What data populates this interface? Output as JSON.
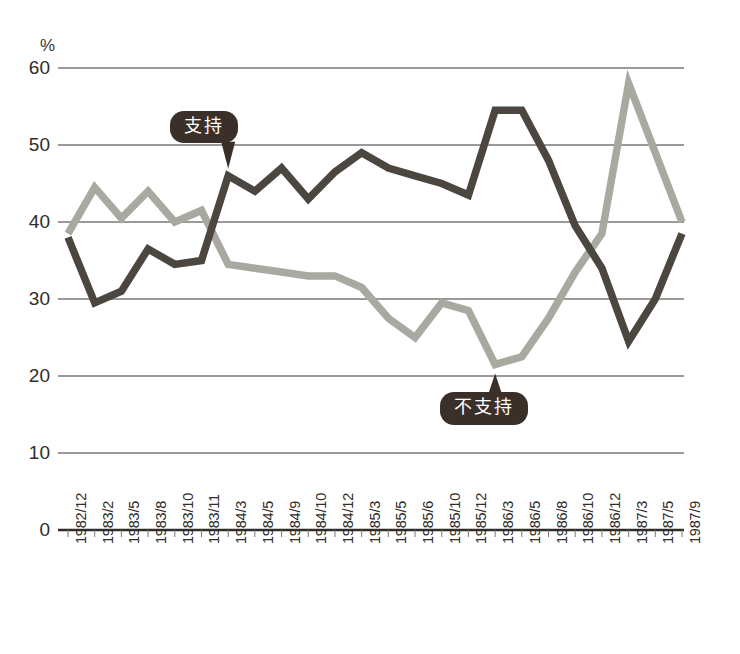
{
  "chart_data": {
    "type": "line",
    "title": "",
    "xlabel": "",
    "ylabel": "%",
    "ylim": [
      0,
      60
    ],
    "yticks": [
      0,
      10,
      20,
      30,
      40,
      50,
      60
    ],
    "grid": true,
    "legend_position": "inline-callouts",
    "categories": [
      "1982/12",
      "1983/2",
      "1983/5",
      "1983/8",
      "1983/10",
      "1983/11",
      "1984/3",
      "1984/5",
      "1984/9",
      "1984/10",
      "1984/12",
      "1985/3",
      "1985/5",
      "1985/6",
      "1985/10",
      "1985/12",
      "1986/3",
      "1986/5",
      "1986/8",
      "1986/10",
      "1986/12",
      "1987/3",
      "1987/5",
      "1987/9"
    ],
    "series": [
      {
        "name": "支持",
        "color": "#4b4640",
        "values": [
          38.0,
          29.5,
          31.0,
          36.5,
          34.5,
          35.0,
          46.0,
          44.0,
          47.0,
          43.0,
          46.5,
          49.0,
          47.0,
          46.0,
          45.0,
          43.5,
          54.5,
          54.5,
          48.0,
          39.5,
          34.0,
          24.5,
          30.0,
          38.5
        ]
      },
      {
        "name": "不支持",
        "color": "#a9a9a1",
        "values": [
          38.5,
          44.5,
          40.5,
          44.0,
          40.0,
          41.5,
          34.5,
          34.0,
          33.5,
          33.0,
          33.0,
          31.5,
          27.5,
          25.0,
          29.5,
          28.5,
          21.5,
          22.5,
          27.5,
          33.5,
          38.5,
          58.0,
          49.0,
          40.0
        ]
      }
    ],
    "annotations": [
      {
        "label": "支持",
        "target_category": "1984/3",
        "target_value": 46.0
      },
      {
        "label": "不支持",
        "target_category": "1986/3",
        "target_value": 21.5
      }
    ]
  },
  "axis": {
    "unit_label": "%",
    "y_tick_labels": [
      "60",
      "50",
      "40",
      "30",
      "20",
      "10",
      "0"
    ]
  }
}
